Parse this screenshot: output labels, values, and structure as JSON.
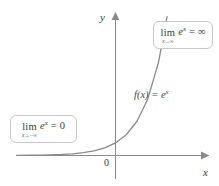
{
  "figure": {
    "background_color": "#ffffff",
    "curve_color": "#8a8a8a",
    "axis_color": "#8a8a8a",
    "text_color": "#3a3a3a",
    "callout_border_color": "#c9c9c9"
  },
  "axes": {
    "y_label": "y",
    "x_label": "x",
    "origin_label": "0"
  },
  "function_label": {
    "prefix": "f(x) = e",
    "exponent": "x",
    "full": "f(x) = e^x"
  },
  "callouts": [
    {
      "id": "limit-at-positive-infinity",
      "operator": "lim",
      "subscript": "x→∞",
      "body_base": "e",
      "body_exponent": "x",
      "equals": "=",
      "result": "∞",
      "full": "lim (x→∞) e^x = ∞"
    },
    {
      "id": "limit-at-negative-infinity",
      "operator": "lim",
      "subscript": "x→−∞",
      "body_base": "e",
      "body_exponent": "x",
      "equals": "=",
      "result": "0",
      "full": "lim (x→−∞) e^x = 0"
    }
  ],
  "chart_data": {
    "type": "line",
    "title": "",
    "xlabel": "x",
    "ylabel": "y",
    "legend": [],
    "grid": false,
    "series": [
      {
        "name": "f(x) = e^x",
        "expression": "e^x",
        "x": [
          -4.6,
          -4.0,
          -3.5,
          -3.0,
          -2.5,
          -2.0,
          -1.5,
          -1.0,
          -0.5,
          0.0,
          0.5,
          1.0,
          1.5,
          2.0,
          2.4
        ],
        "values": [
          0.01,
          0.018,
          0.03,
          0.05,
          0.082,
          0.135,
          0.223,
          0.368,
          0.607,
          1.0,
          1.649,
          2.718,
          4.482,
          7.389,
          11.02
        ]
      }
    ],
    "xlim": [
      -4.8,
      3.0
    ],
    "ylim": [
      -1.0,
      13.0
    ],
    "annotations": [
      {
        "text": "f(x) = e^x",
        "x": 1.0,
        "y": 3.6
      },
      {
        "text": "lim (x→∞) e^x = ∞",
        "x": 1.9,
        "y": 11.9
      },
      {
        "text": "lim (x→−∞) e^x = 0",
        "x": -3.6,
        "y": 2.1
      }
    ]
  }
}
